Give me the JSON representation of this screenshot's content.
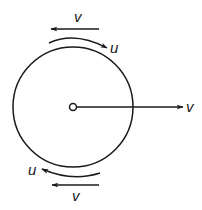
{
  "diagram": {
    "type": "rolling-wheel-velocity-diagram",
    "colors": {
      "stroke": "#1a1a1a",
      "background": "#ffffff"
    },
    "wheel": {
      "center": [
        73,
        107
      ],
      "radius": 60
    },
    "labels": {
      "top_translation": "v",
      "top_rotation": "u",
      "center_translation": "v",
      "bottom_rotation": "u",
      "bottom_translation": "v"
    }
  }
}
